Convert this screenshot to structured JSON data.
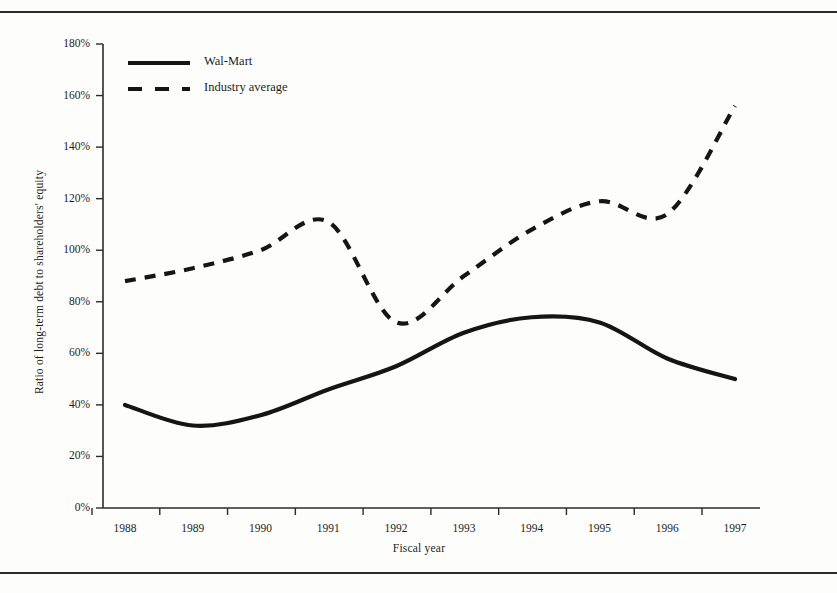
{
  "figure": {
    "rules": [
      "top-rule",
      "bottom-rule"
    ]
  },
  "legend": {
    "items": [
      {
        "label": "Wal-Mart",
        "style": "solid",
        "color": "#151515"
      },
      {
        "label": "Industry average",
        "style": "dashed",
        "color": "#151515"
      }
    ]
  },
  "axes": {
    "y_title": "Ratio of long-term debt to shareholders' equity",
    "x_title": "Fiscal year",
    "y_ticks": [
      "0%",
      "20%",
      "40%",
      "60%",
      "80%",
      "100%",
      "120%",
      "140%",
      "160%",
      "180%"
    ],
    "x_ticks": [
      "1988",
      "1989",
      "1990",
      "1991",
      "1992",
      "1993",
      "1994",
      "1995",
      "1996",
      "1997"
    ]
  },
  "chart_data": {
    "type": "line",
    "title": "",
    "xlabel": "Fiscal year",
    "ylabel": "Ratio of long-term debt to shareholders' equity",
    "x": [
      1988,
      1989,
      1990,
      1991,
      1992,
      1993,
      1994,
      1995,
      1996,
      1997
    ],
    "categories": [
      "1988",
      "1989",
      "1990",
      "1991",
      "1992",
      "1993",
      "1994",
      "1995",
      "1996",
      "1997"
    ],
    "series": [
      {
        "name": "Wal-Mart",
        "style": "solid",
        "color": "#151515",
        "values": [
          40,
          32,
          36,
          46,
          55,
          68,
          74,
          72,
          58,
          50
        ],
        "unit": "%"
      },
      {
        "name": "Industry average",
        "style": "dashed",
        "color": "#151515",
        "values": [
          88,
          93,
          100,
          111,
          72,
          90,
          108,
          119,
          114,
          156
        ],
        "unit": "%"
      }
    ],
    "ylim": [
      0,
      180
    ],
    "ytick_step": 20,
    "xlim": [
      1988,
      1997
    ],
    "grid": false,
    "legend_position": "top-left"
  }
}
